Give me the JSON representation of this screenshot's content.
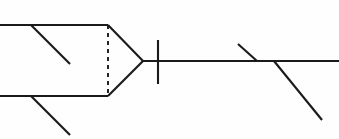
{
  "canvas": {
    "width": 339,
    "height": 139,
    "background_color": "#fefefe",
    "title": "Line Diagram"
  },
  "style": {
    "stroke_color": "#1a1a1a",
    "solid_stroke_width": 2.1,
    "dashed_stroke_width": 1.9,
    "dash_pattern": "4 4"
  },
  "chart_data": {
    "type": "line",
    "xlabel": "",
    "ylabel": "",
    "xlim": [
      0,
      339
    ],
    "ylim": [
      0,
      139
    ],
    "grid": false,
    "legend": "none",
    "segments": [
      {
        "name": "upper-left-horizontal",
        "style": "solid",
        "x": [
          0,
          108
        ],
        "y": [
          25,
          25
        ]
      },
      {
        "name": "upper-left-diagonal-branch",
        "style": "solid",
        "x": [
          31,
          70
        ],
        "y": [
          25,
          64
        ]
      },
      {
        "name": "lower-left-horizontal",
        "style": "solid",
        "x": [
          0,
          108
        ],
        "y": [
          96,
          96
        ]
      },
      {
        "name": "lower-left-diagonal-branch",
        "style": "solid",
        "x": [
          31,
          70
        ],
        "y": [
          96,
          135
        ]
      },
      {
        "name": "vertical-dashed-connector",
        "style": "dashed",
        "x": [
          108,
          108
        ],
        "y": [
          25,
          96
        ]
      },
      {
        "name": "upper-converging-edge",
        "style": "solid",
        "x": [
          108,
          143
        ],
        "y": [
          25,
          61
        ]
      },
      {
        "name": "lower-converging-edge",
        "style": "solid",
        "x": [
          108,
          143
        ],
        "y": [
          96,
          61
        ]
      },
      {
        "name": "main-horizontal-axis",
        "style": "solid",
        "x": [
          143,
          339
        ],
        "y": [
          61,
          61
        ]
      },
      {
        "name": "vertical-tick-mark",
        "style": "solid",
        "x": [
          158,
          158
        ],
        "y": [
          40,
          84
        ]
      },
      {
        "name": "short-diagonal-tick",
        "style": "solid",
        "x": [
          238,
          257
        ],
        "y": [
          44,
          61
        ]
      },
      {
        "name": "long-diagonal-tail",
        "style": "solid",
        "x": [
          274,
          322
        ],
        "y": [
          61,
          120
        ]
      }
    ]
  }
}
